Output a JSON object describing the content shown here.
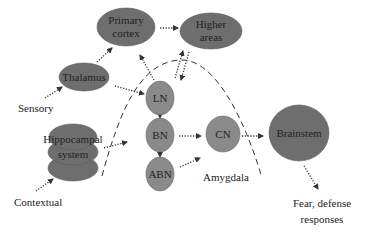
{
  "diagram": {
    "nodes": {
      "primary_cortex": {
        "line1": "Primary",
        "line2": "cortex"
      },
      "higher_areas": {
        "line1": "Higher",
        "line2": "areas"
      },
      "thalamus": {
        "label": "Thalamus"
      },
      "hippocampal": {
        "line1": "Hippocampal",
        "line2": "system"
      },
      "ln": {
        "label": "LN"
      },
      "bn": {
        "label": "BN"
      },
      "abn": {
        "label": "ABN"
      },
      "cn": {
        "label": "CN"
      },
      "brainstem": {
        "label": "Brainstem"
      }
    },
    "labels": {
      "sensory": "Sensory",
      "contextual": "Contextual",
      "amygdala": "Amygdala",
      "output_line1": "Fear, defense",
      "output_line2": "responses"
    },
    "edges": [
      {
        "from": "Sensory",
        "to": "Thalamus"
      },
      {
        "from": "Thalamus",
        "to": "Primary cortex"
      },
      {
        "from": "Primary cortex",
        "to": "Higher areas"
      },
      {
        "from": "Thalamus",
        "to": "LN"
      },
      {
        "from": "LN",
        "to": "Primary cortex"
      },
      {
        "from": "Higher areas",
        "to": "LN"
      },
      {
        "from": "LN",
        "to": "Higher areas"
      },
      {
        "from": "Contextual",
        "to": "Hippocampal system"
      },
      {
        "from": "Hippocampal system",
        "to": "BN"
      },
      {
        "from": "LN",
        "to": "BN"
      },
      {
        "from": "BN",
        "to": "ABN"
      },
      {
        "from": "BN",
        "to": "CN"
      },
      {
        "from": "ABN",
        "to": "CN"
      },
      {
        "from": "CN",
        "to": "Brainstem"
      },
      {
        "from": "Brainstem",
        "to": "Fear, defense responses"
      }
    ],
    "colors": {
      "node_fill": "#6e6e6e",
      "nucleus_fill": "#8a8a8a",
      "text": "#222222",
      "background": "#ffffff"
    }
  }
}
